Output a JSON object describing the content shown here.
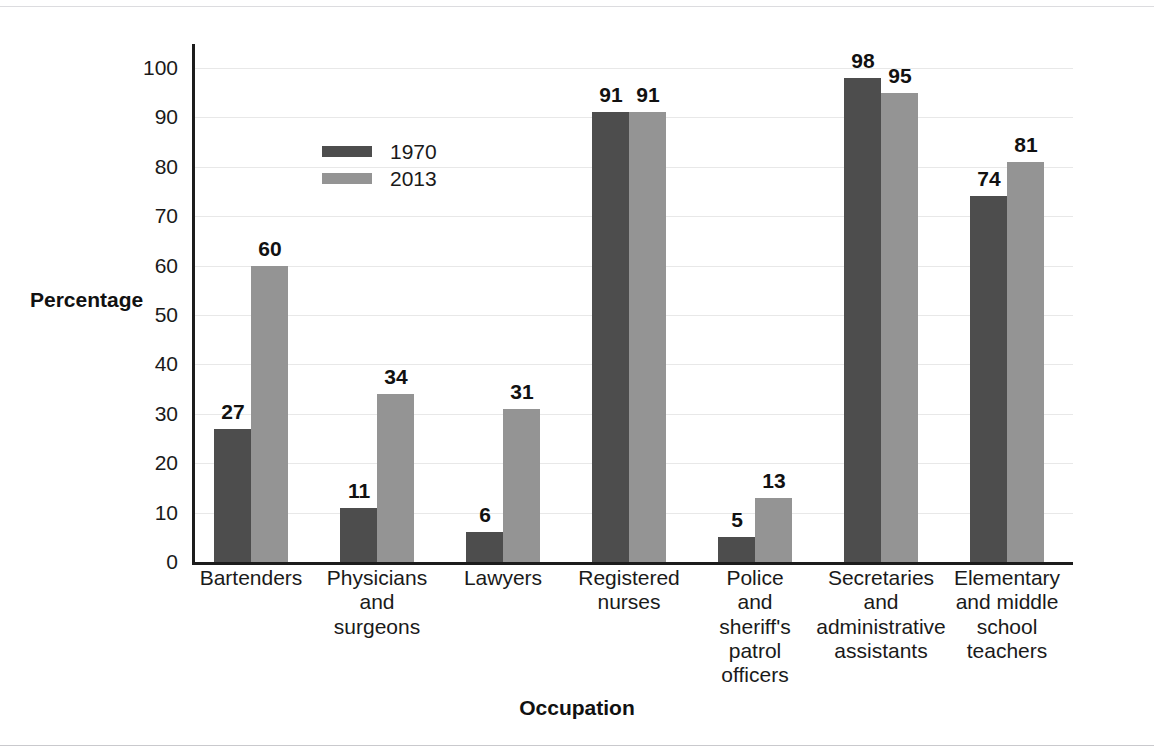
{
  "chart_data": {
    "type": "bar",
    "title": "",
    "xlabel": "Occupation",
    "ylabel": "Percentage",
    "ylim": [
      0,
      100
    ],
    "yticks": [
      0,
      10,
      20,
      30,
      40,
      50,
      60,
      70,
      80,
      90,
      100
    ],
    "ytick_labels": [
      "0",
      "10",
      "20",
      "30",
      "40",
      "50",
      "60",
      "70",
      "80",
      "90",
      "100"
    ],
    "grid": true,
    "legend_position": "upper-left-inside",
    "categories": [
      "Bartenders",
      "Physicians and surgeons",
      "Lawyers",
      "Registered nurses",
      "Police and sheriff's patrol officers",
      "Secretaries and administrative assistants",
      "Elementary and middle school teachers"
    ],
    "category_lines": [
      [
        "Bartenders"
      ],
      [
        "Physicians",
        "and",
        "surgeons"
      ],
      [
        "Lawyers"
      ],
      [
        "Registered",
        "nurses"
      ],
      [
        "Police",
        "and",
        "sheriff's",
        "patrol",
        "officers"
      ],
      [
        "Secretaries",
        "and",
        "administrative",
        "assistants"
      ],
      [
        "Elementary",
        "and middle",
        "school",
        "teachers"
      ]
    ],
    "series": [
      {
        "name": "1970",
        "color": "#4d4d4d",
        "values": [
          27,
          11,
          6,
          91,
          5,
          98,
          74
        ],
        "labels": [
          "27",
          "11",
          "6",
          "91",
          "5",
          "98",
          "74"
        ]
      },
      {
        "name": "2013",
        "color": "#949494",
        "values": [
          60,
          34,
          31,
          91,
          13,
          95,
          81
        ],
        "labels": [
          "60",
          "34",
          "31",
          "91",
          "13",
          "95",
          "81"
        ]
      }
    ]
  },
  "legend": {
    "entries": [
      {
        "label": "1970",
        "color": "#4d4d4d"
      },
      {
        "label": "2013",
        "color": "#949494"
      }
    ]
  },
  "axes": {
    "y_title": "Percentage",
    "x_title": "Occupation"
  },
  "colors": {
    "series_1970": "#4d4d4d",
    "series_2013": "#949494",
    "axis": "#1c1c1c",
    "grid": "#e8e8e8",
    "text": "#1a1a1a",
    "background": "#ffffff"
  }
}
